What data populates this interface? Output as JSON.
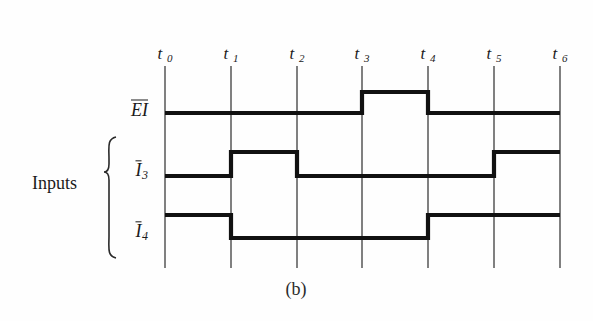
{
  "figure": {
    "caption": "(b)",
    "group_label": "Inputs",
    "background_color": "#fefefe",
    "line_color": "#111111",
    "grid_color": "#4a4a4a"
  },
  "time_axis": {
    "labels": [
      "t0",
      "t1",
      "t2",
      "t3",
      "t4",
      "t5",
      "t6"
    ],
    "display": [
      "t",
      "t",
      "t",
      "t",
      "t",
      "t",
      "t"
    ],
    "subscripts": [
      "0",
      "1",
      "2",
      "3",
      "4",
      "5",
      "6"
    ],
    "x_positions": [
      165,
      231,
      297,
      362,
      428,
      494,
      560
    ],
    "grid_top": 66,
    "grid_bottom": 268,
    "label_y": 44
  },
  "chart_data": {
    "type": "line",
    "title": "(b)",
    "xlabel": "",
    "ylabel": "",
    "categories": [
      "t0",
      "t1",
      "t2",
      "t3",
      "t4",
      "t5",
      "t6"
    ],
    "series": [
      {
        "name": "EI",
        "overbar": true,
        "base": "EI",
        "subscript": "",
        "values": [
          0,
          0,
          0,
          1,
          0,
          0,
          0
        ],
        "levels": {
          "high_y": 92,
          "low_y": 113
        },
        "label_x": 148,
        "label_y": 110,
        "description": "LOW from t0 to t3, HIGH from t3 to t4, LOW from t4 to t6"
      },
      {
        "name": "I3",
        "overbar": true,
        "base": "I",
        "subscript": "3",
        "values": [
          0,
          1,
          0,
          0,
          0,
          1,
          1
        ],
        "levels": {
          "high_y": 152,
          "low_y": 176
        },
        "label_x": 148,
        "label_y": 172,
        "description": "LOW from t0 to t1, HIGH from t1 to t2, LOW from t2 to t5, HIGH from t5 to t6"
      },
      {
        "name": "I4",
        "overbar": true,
        "base": "I",
        "subscript": "4",
        "values": [
          1,
          0,
          0,
          0,
          1,
          1,
          1
        ],
        "levels": {
          "high_y": 215,
          "low_y": 238
        },
        "label_x": 148,
        "label_y": 233,
        "description": "HIGH from t0 to t1, LOW from t1 to t4, HIGH from t4 to t6"
      }
    ],
    "grid": true,
    "legend_position": "left"
  },
  "brace": {
    "x": 104,
    "top": 137,
    "bottom": 258,
    "tip_y": 172,
    "width": 12
  }
}
